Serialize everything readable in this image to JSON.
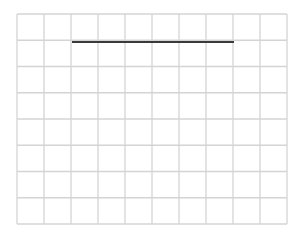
{
  "grid": {
    "left": 17,
    "top": 14,
    "right": 287,
    "bottom": 224,
    "columns": 10,
    "rows": 8,
    "line_color": "#d4d4d4",
    "line_width": 1.3
  },
  "stroke": {
    "x1": 72,
    "y1": 42,
    "x2": 234,
    "y2": 42,
    "color": "#3a3a3a",
    "width": 2
  }
}
